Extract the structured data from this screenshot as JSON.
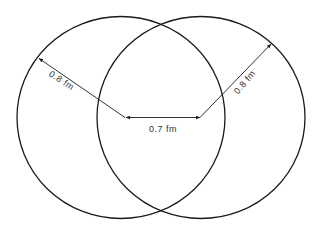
{
  "diagram": {
    "colors": {
      "stroke": "#1a1a1a",
      "text": "#333333",
      "background": "#ffffff"
    },
    "circles": [
      {
        "name": "left-circle",
        "cx": 121,
        "cy": 117.5,
        "rx": 104,
        "ry": 101
      },
      {
        "name": "right-circle",
        "cx": 201,
        "cy": 117.5,
        "rx": 104,
        "ry": 101
      }
    ],
    "labels": {
      "left_radius": "0.8 fm",
      "right_radius": "0.8 fm",
      "center_distance": "0.7 fm"
    }
  }
}
